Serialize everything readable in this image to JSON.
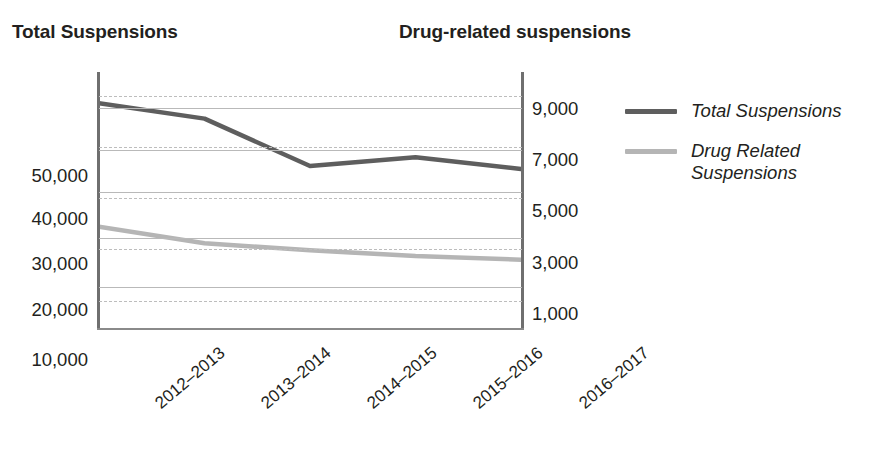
{
  "headings": {
    "left_axis_title": "Total Suspensions",
    "right_axis_title": "Drug-related suspensions"
  },
  "legend": {
    "items": [
      {
        "label": "Total Suspensions",
        "color": "#5e5e5e",
        "swatch_icon": "line-swatch"
      },
      {
        "label": "Drug Related Suspensions",
        "color": "#b5b5b5",
        "swatch_icon": "line-swatch"
      }
    ]
  },
  "colors": {
    "total_line": "#5e5e5e",
    "drug_line": "#b5b5b5",
    "axis": "#6f6f6f",
    "gridline_solid": "#b9b9b9",
    "gridline_dashed": "#bdbdbd",
    "text": "#231f20"
  },
  "chart_data": {
    "type": "line",
    "title": "",
    "xlabel": "",
    "categories": [
      "2012–2013",
      "2013–2014",
      "2014–2015",
      "2015–2016",
      "2016–2017"
    ],
    "series": [
      {
        "name": "Total Suspensions",
        "axis": "left",
        "color": "#5e5e5e",
        "values": [
          54500,
          50800,
          39400,
          41500,
          38700
        ]
      },
      {
        "name": "Drug Related Suspensions",
        "axis": "right",
        "color": "#b5b5b5",
        "values": [
          4400,
          3700,
          3400,
          3150,
          3000
        ]
      }
    ],
    "left_axis": {
      "label": "Total Suspensions",
      "ticks": [
        "10,000",
        "20,000",
        "30,000",
        "40,000",
        "50,000"
      ],
      "tick_values": [
        10000,
        20000,
        30000,
        40000,
        50000
      ],
      "ylim": [
        0,
        62000
      ],
      "gridline_style": "solid"
    },
    "right_axis": {
      "label": "Drug-related suspensions",
      "ticks": [
        "1,000",
        "3,000",
        "5,000",
        "7,000",
        "9,000"
      ],
      "tick_values": [
        1000,
        3000,
        5000,
        7000,
        9000
      ],
      "ylim": [
        0,
        11000
      ],
      "gridline_style": "dashed"
    },
    "grid": true,
    "legend_position": "right"
  }
}
